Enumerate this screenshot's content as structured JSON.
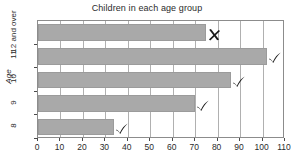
{
  "chart_data": {
    "type": "bar",
    "orientation": "horizontal",
    "title": "Children in each age group",
    "xlabel": "",
    "ylabel": "Age",
    "categories": [
      "8",
      "9",
      "10",
      "11",
      "12 and over"
    ],
    "values": [
      34,
      70,
      86,
      102,
      75
    ],
    "xlim": [
      0,
      110
    ],
    "xticks": [
      0,
      10,
      20,
      30,
      40,
      50,
      60,
      70,
      80,
      90,
      100,
      110
    ],
    "xtick_labels": [
      "0",
      "10",
      "20",
      "30",
      "40",
      "50",
      "60",
      "70",
      "80",
      "90",
      "100",
      "110"
    ],
    "grid": true,
    "grid_axis": "x",
    "legend": false,
    "bar_color": "#a9a9a9",
    "bar_edge_color": "#9b9b9b",
    "axis_color": "#8c8c8c",
    "grid_color": "#b0b0b0",
    "annotations": [
      {
        "category": "12 and over",
        "value": 75,
        "symbol": "cross",
        "glyph": "✗"
      },
      {
        "category": "11",
        "value": 102,
        "symbol": "check",
        "glyph": "✓"
      },
      {
        "category": "10",
        "value": 86,
        "symbol": "check",
        "glyph": "✓"
      },
      {
        "category": "9",
        "value": 70,
        "symbol": "check",
        "glyph": "✓"
      },
      {
        "category": "8",
        "value": 34,
        "symbol": "check",
        "glyph": "✓"
      }
    ]
  }
}
